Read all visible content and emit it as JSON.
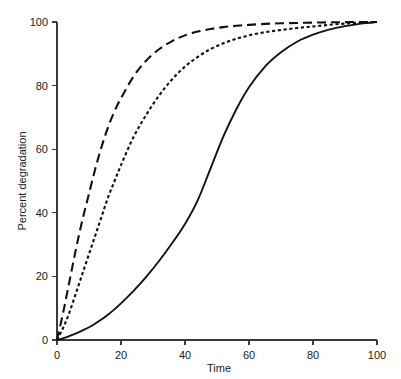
{
  "chart_data": {
    "type": "line",
    "title": "",
    "subtitle": "",
    "xlabel": "Time",
    "ylabel": "Percent degradation",
    "xlim": [
      0,
      100
    ],
    "ylim": [
      0,
      100
    ],
    "xticks": [
      0,
      20,
      40,
      60,
      80,
      100
    ],
    "yticks": [
      0,
      20,
      40,
      60,
      80,
      100
    ],
    "xtick_labels": [
      "0",
      "20",
      "40",
      "60",
      "80",
      "100"
    ],
    "ytick_labels": [
      "0",
      "20",
      "40",
      "60",
      "80",
      "100"
    ],
    "grid": false,
    "legend": "none",
    "x": [
      0,
      2,
      4,
      6,
      8,
      10,
      12,
      14,
      16,
      18,
      20,
      24,
      28,
      32,
      36,
      40,
      44,
      48,
      52,
      56,
      60,
      65,
      70,
      75,
      80,
      85,
      90,
      95,
      100
    ],
    "series": [
      {
        "name": "long-dashed-curve",
        "style": "long-dash",
        "color": "#111111",
        "values": [
          0,
          9,
          19,
          29,
          38,
          46,
          54,
          61,
          67,
          72,
          76,
          83,
          88,
          91.5,
          94,
          95.8,
          97,
          97.8,
          98.4,
          98.8,
          99.1,
          99.4,
          99.6,
          99.7,
          99.8,
          99.9,
          99.95,
          100,
          100
        ]
      },
      {
        "name": "short-dotted-curve",
        "style": "short-dash",
        "color": "#111111",
        "values": [
          0,
          4,
          9,
          15,
          21,
          27,
          33,
          39,
          45,
          50,
          55,
          64,
          71,
          77,
          82,
          86,
          89,
          91.5,
          93.3,
          94.7,
          95.8,
          96.8,
          97.5,
          98.1,
          98.6,
          99.1,
          99.5,
          99.8,
          100
        ]
      },
      {
        "name": "solid-curve",
        "style": "solid",
        "color": "#111111",
        "values": [
          0,
          0.6,
          1.3,
          2.1,
          3.0,
          4.0,
          5.2,
          6.5,
          8.0,
          9.7,
          11.5,
          15.5,
          20.0,
          25.0,
          30.5,
          36.5,
          44.0,
          54.0,
          64.0,
          72.5,
          79.5,
          86.0,
          90.5,
          93.8,
          96.0,
          97.6,
          98.7,
          99.5,
          100
        ]
      }
    ]
  },
  "axis": {
    "x_axis_name": "x-axis",
    "y_axis_name": "y-axis"
  }
}
